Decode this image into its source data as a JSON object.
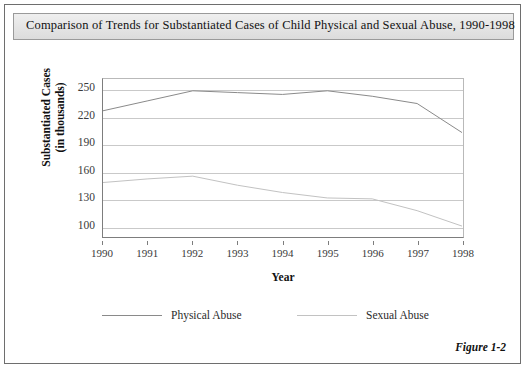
{
  "figure": {
    "title": "Comparison of Trends for Substantiated Cases of Child Physical and Sexual Abuse, 1990-1998",
    "caption": "Figure 1-2"
  },
  "chart_data": {
    "type": "line",
    "title": "Comparison of Trends for Substantiated Cases of Child Physical and Sexual Abuse, 1990-1998",
    "xlabel": "Year",
    "ylabel": "Substantiated Cases (in thousands)",
    "ylabel_line1": "Substantiated Cases",
    "ylabel_line2": "(in thousands)",
    "categories": [
      "1990",
      "1991",
      "1992",
      "1993",
      "1994",
      "1995",
      "1996",
      "1997",
      "1998"
    ],
    "x": [
      1990,
      1991,
      1992,
      1993,
      1994,
      1995,
      1996,
      1997,
      1998
    ],
    "xlim": [
      1990,
      1998
    ],
    "ylim": [
      88,
      262
    ],
    "yticks": [
      250,
      220,
      190,
      160,
      130,
      100
    ],
    "grid": true,
    "legend_position": "bottom",
    "series": [
      {
        "name": "Physical Abuse",
        "color": "#8a8a8a",
        "values": [
          227,
          238,
          249,
          247,
          245,
          249,
          243,
          235,
          203
        ]
      },
      {
        "name": "Sexual Abuse",
        "color": "#c2c2c2",
        "values": [
          148,
          152,
          155,
          145,
          137,
          131,
          130,
          117,
          100
        ]
      }
    ]
  }
}
